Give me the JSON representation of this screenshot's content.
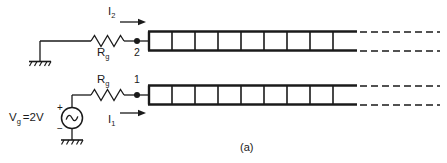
{
  "figure": {
    "caption": "(a)",
    "labels": {
      "current_top": "I",
      "current_top_sub": "2",
      "current_bottom": "I",
      "current_bottom_sub": "1",
      "resistor_top": "R",
      "resistor_top_sub": "g",
      "resistor_bottom": "R",
      "resistor_bottom_sub": "g",
      "node_top": "2",
      "node_bottom": "1",
      "source_label": "V",
      "source_label_sub": "g",
      "source_value": "=2V",
      "polarity_plus": "+",
      "polarity_minus": "−"
    },
    "colors": {
      "ink": "#1a1a1a",
      "background": "#ffffff"
    },
    "components": {
      "source_type": "ac-sine-source",
      "ground_count": 2,
      "resistor_count": 2,
      "ladder_count": 2,
      "ladder_cells": 9,
      "dashed_continuation": true
    }
  }
}
